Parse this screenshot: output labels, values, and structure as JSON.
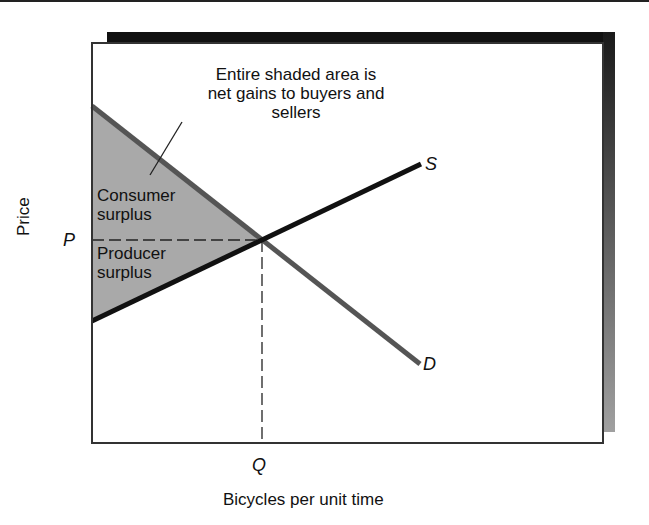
{
  "figure": {
    "annotation": [
      "Entire shaded area is",
      "net gains to buyers and",
      "sellers"
    ],
    "regions": {
      "consumer_surplus": [
        "Consumer",
        "surplus"
      ],
      "producer_surplus": [
        "Producer",
        "surplus"
      ]
    },
    "curves": {
      "supply_label": "S",
      "demand_label": "D"
    },
    "equilibrium": {
      "price_label": "P",
      "quantity_label": "Q"
    },
    "axes": {
      "x_label": "Bicycles per unit time",
      "y_label": "Price"
    },
    "colors": {
      "shade": "#a9a9a9",
      "supply": "#111111",
      "demand": "#555555",
      "frame": "#333333",
      "shadow_top": "#111111",
      "shadow_side_gradient": [
        "#1a1a1a",
        "#a0a0a0"
      ]
    }
  }
}
